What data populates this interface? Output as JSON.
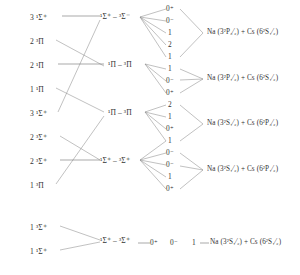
{
  "figure": {
    "type": "correlation-diagram",
    "molecule": "NaCs"
  },
  "columns": {
    "case_a_label": "case (a) states",
    "case_c_label": "case (c) states",
    "omega_label": "Omega",
    "asymptote_label": "atomic asymptotes"
  },
  "case_a_states": [
    {
      "id": "a1",
      "n": "3",
      "mult": "1",
      "term": "Σ",
      "pm": "+",
      "text": "3 ¹Σ⁺",
      "x": 30,
      "y": 18
    },
    {
      "id": "a2",
      "n": "2",
      "mult": "3",
      "term": "Π",
      "pm": "",
      "text": "2 ³Π",
      "x": 30,
      "y": 42
    },
    {
      "id": "a3",
      "n": "2",
      "mult": "1",
      "term": "Π",
      "pm": "",
      "text": "2 ¹Π",
      "x": 30,
      "y": 66
    },
    {
      "id": "a4",
      "n": "1",
      "mult": "1",
      "term": "Π",
      "pm": "",
      "text": "1 ¹Π",
      "x": 30,
      "y": 90
    },
    {
      "id": "a5",
      "n": "3",
      "mult": "1",
      "term": "Σ",
      "pm": "+",
      "text": "3 ¹Σ⁺",
      "x": 30,
      "y": 114
    },
    {
      "id": "a6",
      "n": "2",
      "mult": "3",
      "term": "Σ",
      "pm": "+",
      "text": "2 ³Σ⁺",
      "x": 30,
      "y": 138
    },
    {
      "id": "a7",
      "n": "2",
      "mult": "3",
      "term": "Σ",
      "pm": "+",
      "text": "2 ³Σ⁺",
      "x": 30,
      "y": 162
    },
    {
      "id": "a8",
      "n": "1",
      "mult": "3",
      "term": "Π",
      "pm": "",
      "text": "1 ³Π",
      "x": 30,
      "y": 186
    },
    {
      "id": "a9",
      "n": "1",
      "mult": "3",
      "term": "Σ",
      "pm": "+",
      "text": "1 ³Σ⁺",
      "x": 30,
      "y": 228
    },
    {
      "id": "a10",
      "n": "1",
      "mult": "1",
      "term": "Σ",
      "pm": "+",
      "text": "1 ¹Σ⁺",
      "x": 30,
      "y": 252
    }
  ],
  "case_c_states": [
    {
      "id": "c1",
      "text": "¹Σ⁺ – ³Σ⁻",
      "x": 105,
      "y": 18,
      "left": "1Σ+",
      "right": "3Σ-"
    },
    {
      "id": "c2",
      "text": "¹Π – ³Π",
      "x": 110,
      "y": 66,
      "left": "1Π",
      "right": "3Π"
    },
    {
      "id": "c3",
      "text": "¹Π – ³Π",
      "x": 110,
      "y": 114,
      "left": "1Π",
      "right": "3Π"
    },
    {
      "id": "c4",
      "text": "¹Σ⁺ – ³Σ⁺",
      "x": 105,
      "y": 162,
      "left": "1Σ+",
      "right": "3Σ+"
    },
    {
      "id": "c5",
      "text": "¹Σ⁺ – ³Σ⁺",
      "x": 105,
      "y": 240,
      "left": "1Σ+",
      "right": "3Σ+"
    }
  ],
  "omega_groups": [
    {
      "group": "g1",
      "asymptote_ref": "as1",
      "values": [
        {
          "text": "0⁺",
          "x": 168,
          "y": 10
        },
        {
          "text": "0⁻",
          "x": 168,
          "y": 22
        },
        {
          "text": "1",
          "x": 170,
          "y": 34
        },
        {
          "text": "2",
          "x": 170,
          "y": 46
        },
        {
          "text": "1",
          "x": 170,
          "y": 58
        }
      ]
    },
    {
      "group": "g2",
      "asymptote_ref": "as2",
      "values": [
        {
          "text": "1",
          "x": 170,
          "y": 70
        },
        {
          "text": "0⁻",
          "x": 168,
          "y": 82
        },
        {
          "text": "0⁺",
          "x": 168,
          "y": 94
        }
      ]
    },
    {
      "group": "g3",
      "asymptote_ref": "as3",
      "values": [
        {
          "text": "2",
          "x": 170,
          "y": 106
        },
        {
          "text": "1",
          "x": 170,
          "y": 118
        },
        {
          "text": "0⁺",
          "x": 168,
          "y": 130
        }
      ]
    },
    {
      "group": "g4",
      "asymptote_ref": "as4",
      "values": [
        {
          "text": "1",
          "x": 170,
          "y": 142
        },
        {
          "text": "0⁻",
          "x": 168,
          "y": 154
        },
        {
          "text": "0⁻",
          "x": 168,
          "y": 166
        },
        {
          "text": "1",
          "x": 170,
          "y": 178
        },
        {
          "text": "0⁺",
          "x": 168,
          "y": 190
        }
      ]
    }
  ],
  "ground_omega": [
    {
      "text": "0⁺",
      "x": 152,
      "y": 246
    },
    {
      "text": "0⁻",
      "x": 172,
      "y": 246
    },
    {
      "text": "1",
      "x": 194,
      "y": 246
    }
  ],
  "asymptotes": [
    {
      "id": "as1",
      "x": 207,
      "y": 33,
      "text": "Na (3²P₃⁄₂)  +  Cs (6²S₁⁄₂)",
      "atom1": {
        "element": "Na",
        "config": "3",
        "mult": "2",
        "term": "P",
        "j": "3/2"
      },
      "atom2": {
        "element": "Cs",
        "config": "6",
        "mult": "2",
        "term": "S",
        "j": "1/2"
      }
    },
    {
      "id": "as2",
      "x": 207,
      "y": 79,
      "text": "Na (3²P₁⁄₂)  +  Cs (6²S₁⁄₂)",
      "atom1": {
        "element": "Na",
        "config": "3",
        "mult": "2",
        "term": "P",
        "j": "1/2"
      },
      "atom2": {
        "element": "Cs",
        "config": "6",
        "mult": "2",
        "term": "S",
        "j": "1/2"
      }
    },
    {
      "id": "as3",
      "x": 207,
      "y": 124,
      "text": "Na (3²S₁⁄₂)  +  Cs (6²P₃⁄₂)",
      "atom1": {
        "element": "Na",
        "config": "3",
        "mult": "2",
        "term": "S",
        "j": "1/2"
      },
      "atom2": {
        "element": "Cs",
        "config": "6",
        "mult": "2",
        "term": "P",
        "j": "3/2"
      }
    },
    {
      "id": "as4",
      "x": 207,
      "y": 170,
      "text": "Na (3²S₁⁄₂)  +  Cs (6²P₁⁄₂)",
      "atom1": {
        "element": "Na",
        "config": "3",
        "mult": "2",
        "term": "S",
        "j": "1/2"
      },
      "atom2": {
        "element": "Cs",
        "config": "6",
        "mult": "2",
        "term": "P",
        "j": "1/2"
      }
    },
    {
      "id": "as5",
      "x": 212,
      "y": 246,
      "text": "Na (3²S₁⁄₂)  +  Cs (6²S₁⁄₂)",
      "atom1": {
        "element": "Na",
        "config": "3",
        "mult": "2",
        "term": "S",
        "j": "1/2"
      },
      "atom2": {
        "element": "Cs",
        "config": "6",
        "mult": "2",
        "term": "S",
        "j": "1/2"
      }
    }
  ],
  "connectors": {
    "stroke": "#8d8d8d",
    "stroke_dark": "#6f6f6f"
  }
}
